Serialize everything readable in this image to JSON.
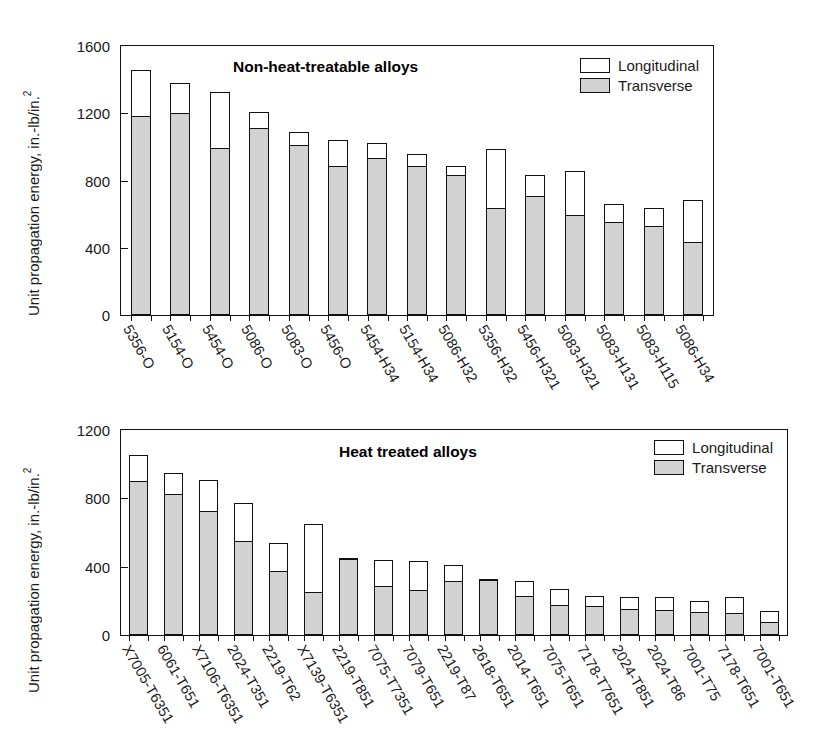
{
  "figure": {
    "axis_title": "Unit propagation energy, in.-lb/in.",
    "axis_title_exponent": "2",
    "legend": {
      "longitudinal": "Longitudinal",
      "transverse": "Transverse"
    },
    "colors": {
      "transverse_fill": "#d2d2d2",
      "longitudinal_fill": "#ffffff",
      "outline": "#111111"
    }
  },
  "chart_data": [
    {
      "type": "bar",
      "title": "Non-heat-treatable alloys",
      "xlabel": "",
      "ylabel": "Unit propagation energy, in.-lb/in.2",
      "ylim": [
        0,
        1600
      ],
      "yticks": [
        0,
        400,
        800,
        1200,
        1600
      ],
      "ytick_labels": [
        "0",
        "400",
        "800",
        "1200",
        "1600"
      ],
      "grid": false,
      "legend_position": "top-right",
      "stacked": true,
      "categories": [
        "5356-O",
        "5154-O",
        "5454-O",
        "5086-O",
        "5083-O",
        "5456-O",
        "5454-H34",
        "5154-H34",
        "5086-H32",
        "5356-H32",
        "5456-H321",
        "5083-H321",
        "5083-H131",
        "5083-H115",
        "5086-H34"
      ],
      "series": [
        {
          "name": "Transverse",
          "values": [
            1175,
            1195,
            990,
            1105,
            1005,
            880,
            930,
            880,
            825,
            630,
            700,
            590,
            545,
            525,
            430
          ]
        },
        {
          "name": "Longitudinal",
          "values": [
            1455,
            1380,
            1325,
            1210,
            1090,
            1040,
            1025,
            955,
            885,
            985,
            830,
            855,
            660,
            635,
            685
          ]
        }
      ]
    },
    {
      "type": "bar",
      "title": "Heat treated alloys",
      "xlabel": "",
      "ylabel": "Unit propagation energy, in.-lb/in.2",
      "ylim": [
        0,
        1200
      ],
      "yticks": [
        0,
        400,
        800,
        1200
      ],
      "ytick_labels": [
        "0",
        "400",
        "800",
        "1200"
      ],
      "grid": false,
      "legend_position": "top-right",
      "stacked": true,
      "categories": [
        "X7005-T6351",
        "6061-T651",
        "X7106-T6351",
        "2024-T351",
        "2219-T62",
        "X7139-T6351",
        "2219-T851",
        "7075-T7351",
        "7079-T651",
        "2219-T87",
        "2618-T651",
        "2014-T651",
        "7075-T651",
        "7178-T7651",
        "2024-T851",
        "2024-T86",
        "7001-T75",
        "7178-T651",
        "7001-T651"
      ],
      "series": [
        {
          "name": "Transverse",
          "values": [
            895,
            820,
            720,
            545,
            370,
            245,
            450,
            280,
            255,
            310,
            330,
            225,
            170,
            165,
            145,
            140,
            130,
            125,
            70
          ]
        },
        {
          "name": "Longitudinal",
          "values": [
            1055,
            950,
            905,
            770,
            540,
            650,
            450,
            440,
            435,
            410,
            330,
            315,
            270,
            230,
            220,
            220,
            200,
            225,
            140
          ]
        }
      ]
    }
  ]
}
